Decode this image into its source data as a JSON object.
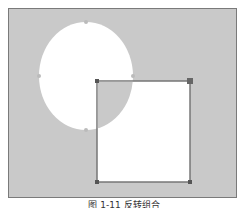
{
  "figure": {
    "caption": "图 1-11 反转组合",
    "background_color": "#c9c9c9",
    "shape_fill": "#ffffff",
    "outline_color": "#777777",
    "ellipse": {
      "cx": 86,
      "cy": 76,
      "rx": 47,
      "ry": 54
    },
    "rectangle": {
      "x": 97,
      "y": 81,
      "width": 93,
      "height": 101
    }
  }
}
